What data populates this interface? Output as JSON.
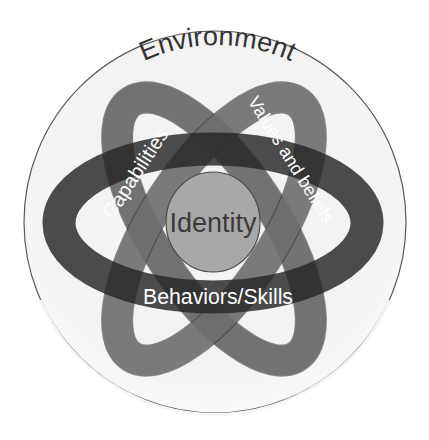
{
  "diagram": {
    "type": "nested-levels-diagram",
    "outer": {
      "label": "Environment",
      "fill": "#f2f2f2",
      "stroke": "#555555",
      "text_color": "#333333"
    },
    "rings": [
      {
        "id": "values",
        "label": "Values and beliefs",
        "color": "#6e6e6e",
        "text_color": "#ffffff"
      },
      {
        "id": "capabilities",
        "label": "Capabilities",
        "color": "#6e6e6e",
        "text_color": "#ffffff"
      },
      {
        "id": "behaviors",
        "label": "Behaviors/Skills",
        "color": "#2e2e2e",
        "text_color": "#ffffff"
      }
    ],
    "center": {
      "label": "Identity",
      "fill": "#a9a9a9",
      "stroke": "#555555",
      "text_color": "#3a3a3a"
    }
  }
}
